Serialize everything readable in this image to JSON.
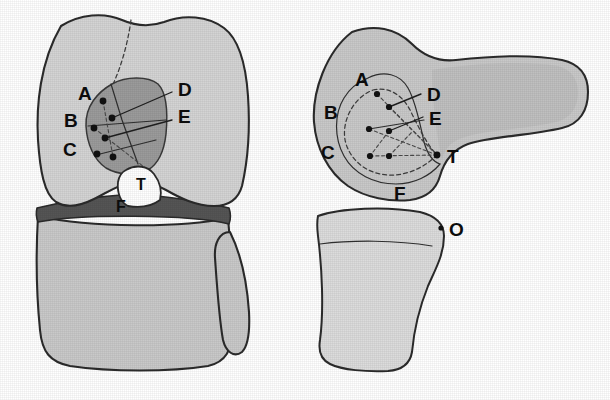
{
  "figure": {
    "views": [
      {
        "id": "anterior-view",
        "name": "Anterior view of knee (femur, meniscus, tibia)",
        "position": "left"
      },
      {
        "id": "lateral-view",
        "name": "Lateral view of knee (femoral condyle, femoral shaft, tibia)",
        "position": "right"
      }
    ]
  },
  "colors": {
    "bone_fill": "#c9c9c9",
    "bone_fill_light": "#d4d4d4",
    "bone_fill_pale": "#dcdcdc",
    "patch_dark": "#9b9b9b",
    "meniscus_dark": "#555555",
    "notch_white": "#ffffff",
    "outline": "#2b2b2b",
    "marker": "#121212",
    "background": "#ffffff"
  },
  "anterior_view": {
    "labels": [
      {
        "key": "A",
        "text": "A",
        "x": 78,
        "y": 100
      },
      {
        "key": "B",
        "text": "B",
        "x": 64,
        "y": 127
      },
      {
        "key": "C",
        "text": "C",
        "x": 63,
        "y": 156
      },
      {
        "key": "D",
        "text": "D",
        "x": 178,
        "y": 96
      },
      {
        "key": "E",
        "text": "E",
        "x": 178,
        "y": 123
      },
      {
        "key": "T",
        "text": "T",
        "x": 142,
        "y": 185
      },
      {
        "key": "F",
        "text": "F",
        "x": 121,
        "y": 206
      }
    ],
    "markers": [
      {
        "id": "m1",
        "x": 103,
        "y": 101
      },
      {
        "id": "m2",
        "x": 112,
        "y": 118
      },
      {
        "id": "m3",
        "x": 94,
        "y": 128
      },
      {
        "id": "m4",
        "x": 105,
        "y": 138
      },
      {
        "id": "m5",
        "x": 97,
        "y": 154
      },
      {
        "id": "m6",
        "x": 113,
        "y": 157
      }
    ],
    "leaders": [
      {
        "id": "leader-D",
        "from_x": 172,
        "from_y": 92,
        "to_x": 112,
        "to_y": 118
      },
      {
        "id": "leader-E",
        "from_x": 172,
        "from_y": 120,
        "to_x": 105,
        "to_y": 138
      }
    ]
  },
  "lateral_view": {
    "labels": [
      {
        "key": "A",
        "text": "A",
        "x": 362,
        "y": 80
      },
      {
        "key": "B",
        "text": "B",
        "x": 330,
        "y": 112
      },
      {
        "key": "C",
        "text": "C",
        "x": 327,
        "y": 152
      },
      {
        "key": "D",
        "text": "D",
        "x": 427,
        "y": 98
      },
      {
        "key": "E",
        "text": "E",
        "x": 429,
        "y": 120
      },
      {
        "key": "T",
        "text": "T",
        "x": 451,
        "y": 157
      },
      {
        "key": "F",
        "text": "F",
        "x": 400,
        "y": 194
      },
      {
        "key": "O",
        "text": "O",
        "x": 451,
        "y": 232
      }
    ],
    "markers": [
      {
        "id": "m1",
        "x": 377,
        "y": 94
      },
      {
        "id": "m2",
        "x": 389,
        "y": 107
      },
      {
        "id": "m3",
        "x": 369,
        "y": 129
      },
      {
        "id": "m4",
        "x": 389,
        "y": 131
      },
      {
        "id": "m5",
        "x": 370,
        "y": 156
      },
      {
        "id": "m6",
        "x": 389,
        "y": 156
      },
      {
        "id": "mT",
        "x": 437,
        "y": 155
      },
      {
        "id": "mO",
        "x": 441,
        "y": 228
      }
    ],
    "leaders": [
      {
        "id": "leader-D",
        "from_x": 421,
        "from_y": 94,
        "to_x": 389,
        "to_y": 107
      },
      {
        "id": "leader-E",
        "from_x": 423,
        "from_y": 117,
        "to_x": 389,
        "to_y": 131
      }
    ]
  }
}
